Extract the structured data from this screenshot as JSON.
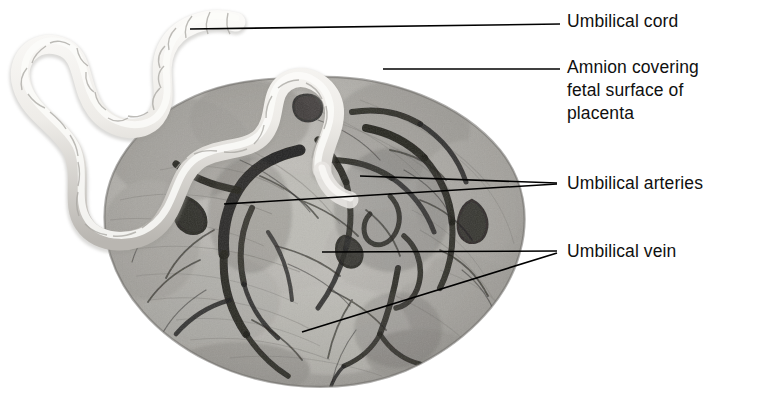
{
  "figure": {
    "background_color": "#ffffff",
    "width": 769,
    "height": 405
  },
  "specimen": {
    "name": "placenta-fetal-surface-photograph",
    "description": "Black and white photograph of a placenta fetal surface with coiled umbilical cord",
    "disc": {
      "center_x": 314,
      "center_y": 232,
      "radius_x": 212,
      "radius_y": 155,
      "fill_color": "#b9b7b2",
      "edge_color": "#7e7c78"
    },
    "cord": {
      "color": "#f2f0ec",
      "shadow_color": "#8f8d88"
    },
    "vessel_color": "#1d1c1a"
  },
  "labels": [
    {
      "id": "umbilical-cord",
      "text": "Umbilical cord",
      "x": 567,
      "y": 10
    },
    {
      "id": "amnion",
      "text": "Amnion covering\nfetal surface of\nplacenta",
      "x": 567,
      "y": 56
    },
    {
      "id": "umbilical-arteries",
      "text": "Umbilical arteries",
      "x": 567,
      "y": 172
    },
    {
      "id": "umbilical-vein",
      "text": "Umbilical vein",
      "x": 567,
      "y": 240
    }
  ],
  "leader_lines": [
    {
      "id": "cord-leader",
      "x1": 190,
      "y1": 29,
      "x2": 560,
      "y2": 24
    },
    {
      "id": "amnion-leader",
      "x1": 383,
      "y1": 69,
      "x2": 560,
      "y2": 69
    },
    {
      "id": "artery-leader-upper",
      "x1": 360,
      "y1": 176,
      "x2": 557,
      "y2": 183
    },
    {
      "id": "artery-leader-lower",
      "x1": 224,
      "y1": 204,
      "x2": 557,
      "y2": 184
    },
    {
      "id": "vein-leader-upper",
      "x1": 322,
      "y1": 252,
      "x2": 557,
      "y2": 251
    },
    {
      "id": "vein-leader-lower",
      "x1": 302,
      "y1": 332,
      "x2": 557,
      "y2": 253
    }
  ],
  "line_style": {
    "color": "#000000",
    "width": 1.6
  }
}
